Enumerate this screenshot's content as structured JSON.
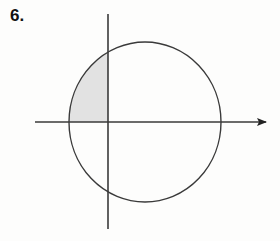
{
  "figure": {
    "problem_number": "6.",
    "background_color": "#fdfdfc",
    "stroke_color": "#3a3a3a",
    "axis_color": "#3a3a3a",
    "shade_fill_color": "#e2e2e2",
    "shade_stroke_color": "#3a3a3a",
    "width": 280,
    "height": 241
  },
  "chart_data": {
    "type": "diagram",
    "title": "",
    "subtitle": "",
    "xlabel": "",
    "ylabel": "",
    "grid": false,
    "legend": "none",
    "origin": {
      "x": 108,
      "y": 122
    },
    "axes": [
      {
        "name": "x-axis",
        "orientation": "horizontal",
        "x1": 35,
        "y1": 122,
        "x2": 272,
        "y2": 122,
        "arrow_end": "right",
        "tick_labels": []
      },
      {
        "name": "y-axis",
        "orientation": "vertical",
        "x1": 108,
        "y1": 14,
        "x2": 108,
        "y2": 229,
        "arrow_end": "none",
        "tick_labels": []
      }
    ],
    "shapes": [
      {
        "name": "circle",
        "type": "ellipse",
        "cx": 145,
        "cy": 122,
        "rx": 76,
        "ry": 80,
        "fill": "none",
        "stroke": "#3a3a3a",
        "stroke_width": 1.4
      }
    ],
    "shaded_regions": [
      {
        "name": "second-quadrant-circular-segment",
        "quadrant": 2,
        "fill": "#e2e2e2",
        "bounds": {
          "left_x": 69,
          "right_x": 108,
          "top_y": 49,
          "bottom_y": 122
        },
        "boundary_points": [
          {
            "x": 108,
            "y": 122
          },
          {
            "x": 69,
            "y": 122
          },
          {
            "x": 108,
            "y": 49
          }
        ]
      }
    ],
    "annotations": [
      {
        "name": "problem-number",
        "text": "6.",
        "x": 12,
        "y": 22
      }
    ]
  }
}
